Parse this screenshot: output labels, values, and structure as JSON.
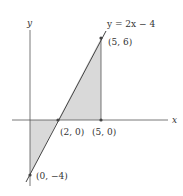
{
  "diagram": {
    "axes": {
      "x_label": "x",
      "y_label": "y"
    },
    "line_label": "y = 2x − 4",
    "points": [
      {
        "id": "p56",
        "label": "(5, 6)"
      },
      {
        "id": "p20",
        "label": "(2, 0)"
      },
      {
        "id": "p50",
        "label": "(5, 0)"
      },
      {
        "id": "p0m4",
        "label": "(0, −4)"
      }
    ],
    "colors": {
      "shade": "#d9d9d9",
      "line": "#444444",
      "axis": "#555555"
    }
  }
}
